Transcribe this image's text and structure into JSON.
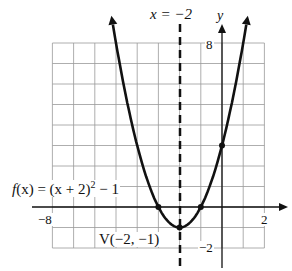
{
  "chart_data": {
    "type": "line",
    "title": "",
    "function_label": "f(x) = (x + 2)² − 1",
    "axis_of_symmetry_label": "x = −2",
    "vertex_label": "V(−2, −1)",
    "xlabel": "",
    "ylabel": "y",
    "xlim": [
      -8,
      2
    ],
    "ylim": [
      -2,
      8
    ],
    "x_tick_labels": [
      "−8",
      "2"
    ],
    "y_tick_labels": [
      "8",
      "−2"
    ],
    "grid": true,
    "series": [
      {
        "name": "f(x) = (x + 2)^2 - 1",
        "points": [
          {
            "x": -3,
            "y": 0
          },
          {
            "x": -2,
            "y": -1
          },
          {
            "x": -1,
            "y": 0
          },
          {
            "x": 0,
            "y": 3
          }
        ]
      }
    ],
    "vertex": {
      "x": -2,
      "y": -1
    },
    "axis_of_symmetry": -2
  },
  "labels": {
    "axis_sym": "x = −2",
    "y_axis": "y",
    "y8": "8",
    "yneg2": "−2",
    "xneg8": "−8",
    "x2": "2",
    "func_f": "f",
    "func_rest": "(x) = (x + 2)",
    "func_sup": "2",
    "func_end": " − 1",
    "vertex": "V(−2, −1)"
  }
}
